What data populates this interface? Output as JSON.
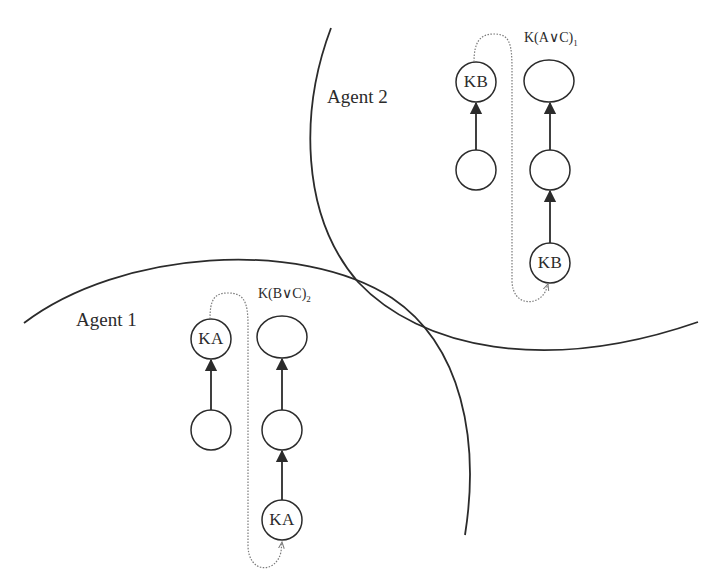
{
  "diagram": {
    "colors": {
      "stroke": "#2b2b2b",
      "dotted": "#7a7a7a",
      "background": "#ffffff"
    },
    "agents": [
      {
        "label": "Agent 1",
        "formula": {
          "base": "K(B∨C)",
          "subscript": "2"
        },
        "nodes": {
          "left_top": "KA",
          "left_bottom": "",
          "right_top": "",
          "right_middle": "",
          "right_bottom": "KA"
        }
      },
      {
        "label": "Agent 2",
        "formula": {
          "base": "K(A∨C)",
          "subscript": "1"
        },
        "nodes": {
          "left_top": "KB",
          "left_bottom": "",
          "right_top": "",
          "right_middle": "",
          "right_bottom": "KB"
        }
      }
    ]
  }
}
